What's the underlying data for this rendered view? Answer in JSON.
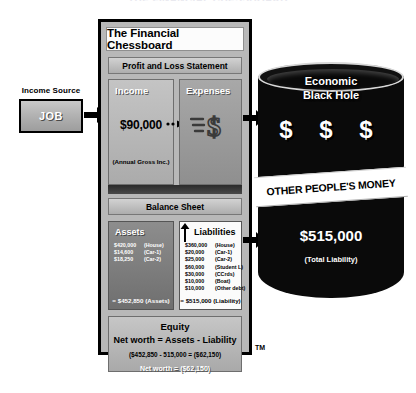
{
  "top_title": "THE FINANCIAL CHESSBOARD",
  "income_source": {
    "label": "Income Source",
    "box_label": "JOB"
  },
  "panel": {
    "title": "The Financial Chessboard",
    "profit_loss_header": "Profit and Loss Statement",
    "income": {
      "header": "Income",
      "amount": "$90,000",
      "note": "(Annual Gross Inc.)"
    },
    "expenses": {
      "header": "Expenses",
      "icon": "money-flying-dollar-icon"
    },
    "balance_sheet_header": "Balance Sheet",
    "assets": {
      "header": "Assets",
      "items": [
        {
          "amount": "$420,000",
          "label": "(House)"
        },
        {
          "amount": "$14,600",
          "label": "(Car-1)"
        },
        {
          "amount": "$18,250",
          "label": "(Car-2)"
        }
      ],
      "total": "= $452,850 (Assets)"
    },
    "liabilities": {
      "header": "Liabilities",
      "items": [
        {
          "amount": "$360,000",
          "label": "(House)"
        },
        {
          "amount": "$20,000",
          "label": "(Car-1)"
        },
        {
          "amount": "$25,000",
          "label": "(Car-2)"
        },
        {
          "amount": "$60,000",
          "label": "(Student L)"
        },
        {
          "amount": "$30,000",
          "label": "(CCrds)"
        },
        {
          "amount": "$10,000",
          "label": "(Boat)"
        },
        {
          "amount": "$10,000",
          "label": "(Other debt)"
        }
      ],
      "total": "= $515,000 (Liability)"
    },
    "equity": {
      "header": "Equity",
      "formula": "Net worth = Assets - Liability",
      "calculation": "($452,850 - 515,000 = ($62,150)",
      "net_worth": "Net worth = ($62,150)"
    },
    "trademark": "TM"
  },
  "black_hole": {
    "title_line1": "Economic",
    "title_line2": "Black Hole",
    "dollar_symbols": "$  $  $",
    "band_label": "OTHER PEOPLE'S MONEY",
    "amount": "$515,000",
    "sub_label": "(Total Liability)"
  },
  "colors": {
    "black": "#0a0a0a",
    "panel_gray": "#b8b8b8",
    "white": "#ffffff"
  }
}
